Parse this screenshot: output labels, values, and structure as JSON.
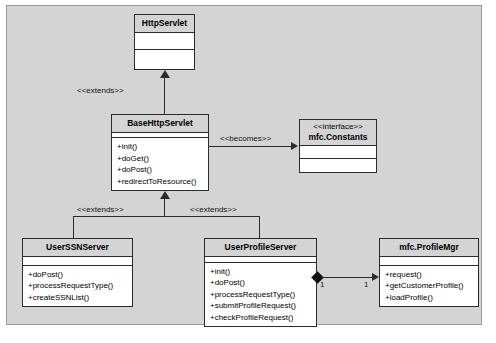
{
  "diagram": {
    "canvas_color": "#d4d4d4",
    "box_fill": "#ffffff",
    "header_fill": "#d4d4d4",
    "line_color": "#2b2b2b"
  },
  "classes": {
    "http_servlet": {
      "name": "HttpServlet",
      "stereotype": "",
      "attributes": [],
      "operations": []
    },
    "base_http_servlet": {
      "name": "BaseHttpServlet",
      "stereotype": "",
      "attributes": [],
      "operations": [
        "+init()",
        "+doGet()",
        "+doPost()",
        "+redirectToResource()"
      ]
    },
    "mfc_constants": {
      "name": "mfc.Constants",
      "stereotype": "<<interface>>",
      "attributes": [],
      "operations": []
    },
    "user_ssn_server": {
      "name": "UserSSNServer",
      "stereotype": "",
      "attributes": [],
      "operations": [
        "+doPost()",
        "+processRequestType()",
        "+createSSNList()"
      ]
    },
    "user_profile_server": {
      "name": "UserProfileServer",
      "stereotype": "",
      "attributes": [],
      "operations": [
        "+init()",
        "+doPost()",
        "+processRequestType()",
        "+submitProfileRequest()",
        "+checkProfileRequest()"
      ]
    },
    "mfc_profile_mgr": {
      "name": "mfc.ProfileMgr",
      "stereotype": "",
      "attributes": [],
      "operations": [
        "+request()",
        "+getCustomerProfile()",
        "+loadProfile()"
      ]
    }
  },
  "relationships": {
    "extends_top": "<<extends>>",
    "extends_left": "<<extends>>",
    "extends_right": "<<extends>>",
    "becomes": "<<becomes>>",
    "mult_source": "1",
    "mult_target": "1"
  }
}
